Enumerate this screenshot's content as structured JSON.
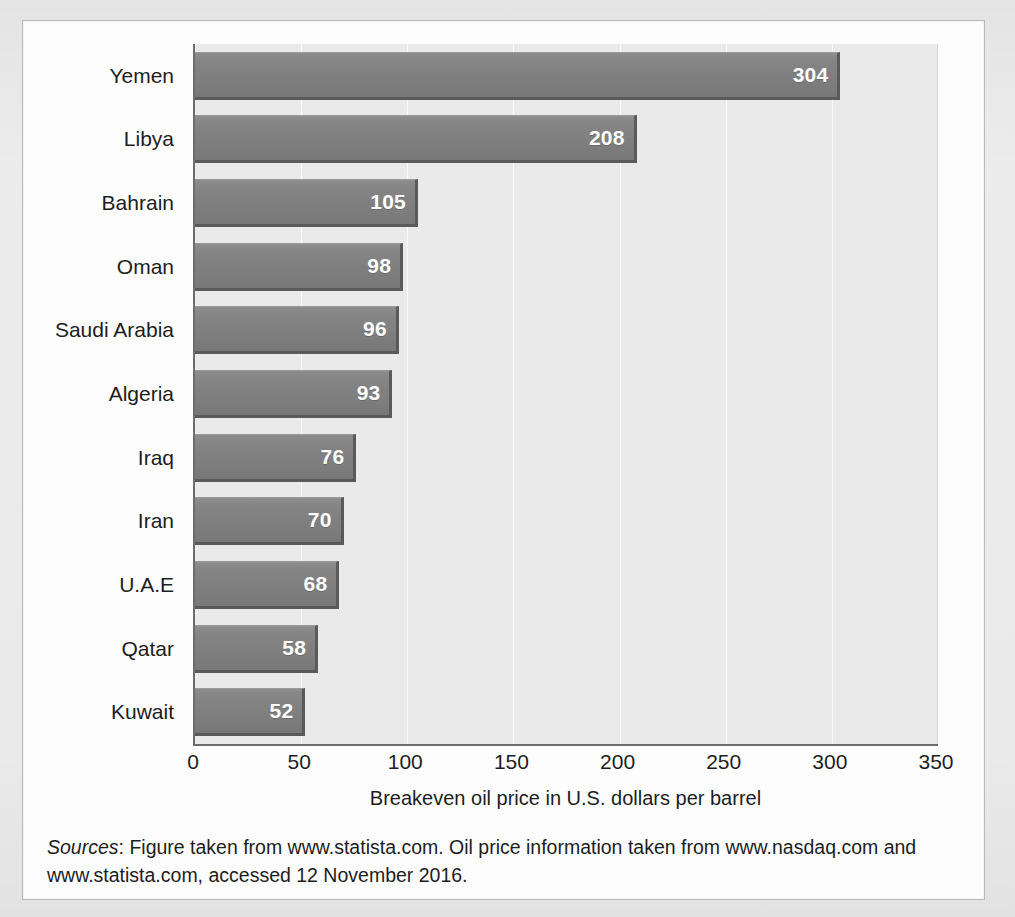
{
  "chart_data": {
    "type": "bar",
    "orientation": "horizontal",
    "title": "",
    "subtitle": "",
    "xlabel": "Breakeven oil price in U.S. dollars per barrel",
    "ylabel": "",
    "xlim": [
      0,
      350
    ],
    "xticks": [
      0,
      50,
      100,
      150,
      200,
      250,
      300,
      350
    ],
    "grid": true,
    "legend": null,
    "categories": [
      "Yemen",
      "Libya",
      "Bahrain",
      "Oman",
      "Saudi Arabia",
      "Algeria",
      "Iraq",
      "Iran",
      "U.A.E",
      "Qatar",
      "Kuwait"
    ],
    "values": [
      304,
      208,
      105,
      98,
      96,
      93,
      76,
      70,
      68,
      58,
      52
    ],
    "value_labels": [
      "304",
      "208",
      "105",
      "98",
      "96",
      "93",
      "76",
      "70",
      "68",
      "58",
      "52"
    ],
    "colors": {
      "bar_fill": "#808080",
      "bar_edge": "#5a5a5a",
      "plot_background": "#eaeaea",
      "gridline": "#fafafa",
      "axis_line": "#6d6d6d",
      "value_label": "#ffffff",
      "text": "#1d1d1d",
      "card_background": "#fdfdfd",
      "page_background": "#e9e9e9"
    }
  },
  "sources": {
    "lead": "Sources",
    "body": ": Figure taken from www.statista.com. Oil price information taken from www.nasdaq.com and www.statista.com, accessed 12 November 2016."
  }
}
